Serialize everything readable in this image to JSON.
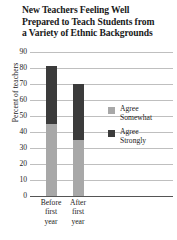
{
  "chart_data": {
    "type": "bar",
    "barmode": "stacked",
    "title": "New Teachers Feeling Well Prepared to Teach Students from a Variety of Ethnic Backgrounds",
    "title_lines": [
      "New Teachers Feeling Well",
      "Prepared to Teach Students from",
      "a Variety of Ethnic Backgrounds"
    ],
    "xlabel": "",
    "ylabel": "Percent of teachers",
    "ylim": [
      0,
      90
    ],
    "ytick_step": 10,
    "yticks": [
      90,
      80,
      70,
      60,
      50,
      40,
      30,
      20,
      10,
      0
    ],
    "ytick_labels": [
      "90",
      "80",
      "70",
      "60",
      "50",
      "40",
      "30",
      "20",
      "10",
      "0"
    ],
    "grid": true,
    "grid_axis": "y",
    "legend_position": "right",
    "categories": [
      "Before first year",
      "After first year"
    ],
    "category_lines": [
      [
        "Before",
        "first",
        "year"
      ],
      [
        "After",
        "first",
        "year"
      ]
    ],
    "series": [
      {
        "name": "Agree Somewhat",
        "color": "#a8a8a8",
        "values": [
          45,
          35
        ]
      },
      {
        "name": "Agree Strongly",
        "color": "#3b3b3b",
        "values": [
          36,
          35
        ]
      }
    ],
    "totals": [
      81,
      70
    ]
  },
  "legend": {
    "items": [
      {
        "label_line1": "Agree",
        "label_line2": "Somewhat",
        "color": "#a8a8a8"
      },
      {
        "label_line1": "Agree",
        "label_line2": "Strongly",
        "color": "#3b3b3b"
      }
    ]
  },
  "colors": {
    "agree_somewhat": "#a8a8a8",
    "agree_strongly": "#3b3b3b",
    "gridline": "#bfbfbf",
    "axis": "#555555",
    "text": "#1a1a1a",
    "background": "#ffffff"
  }
}
